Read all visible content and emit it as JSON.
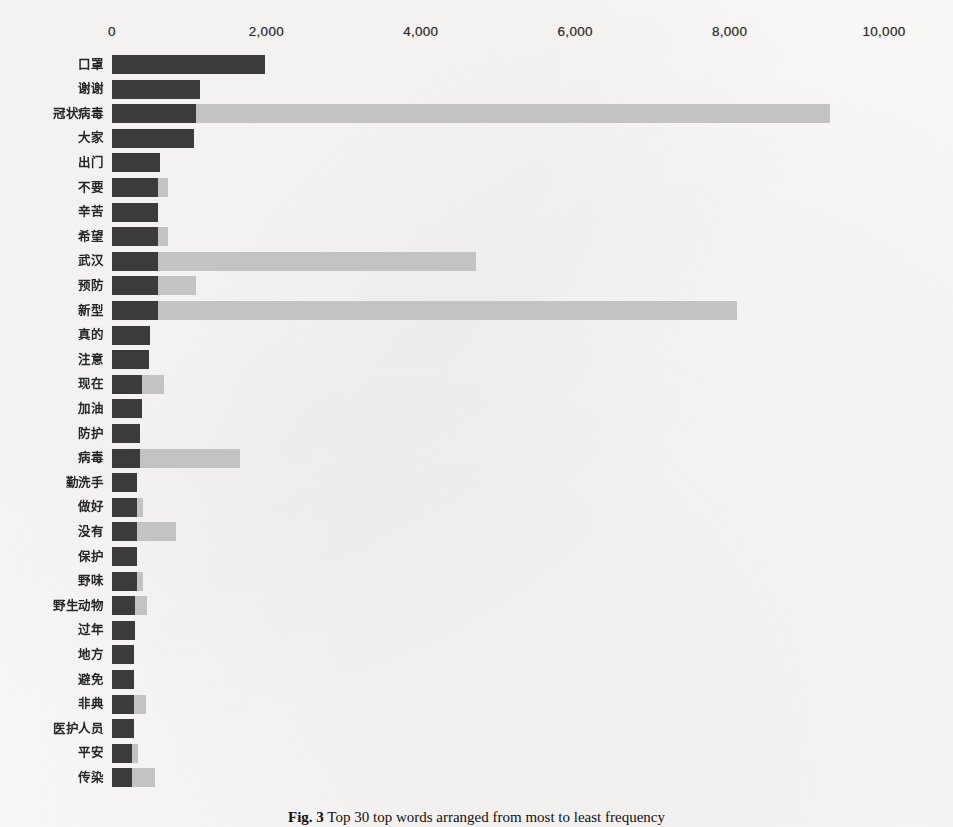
{
  "figure": {
    "caption_label": "Fig. 3",
    "caption_text": "Top 30 top words arranged from most to least frequency",
    "background_color": "#f8f7f5"
  },
  "chart_data": {
    "type": "bar",
    "orientation": "horizontal",
    "stacked": true,
    "title": "",
    "xlabel": "",
    "ylabel": "",
    "xlim": [
      0,
      10800
    ],
    "xticks": [
      0,
      2000,
      4000,
      6000,
      8000,
      10000
    ],
    "xticklabels": [
      "0",
      "2,000",
      "4,000",
      "6,000",
      "8,000",
      "10,000"
    ],
    "grid": false,
    "legend": "none",
    "colors": {
      "series_1": "#3b3b3b",
      "series_2": "#c3c3c3"
    },
    "categories": [
      "口罩",
      "谢谢",
      "冠状病毒",
      "大家",
      "出门",
      "不要",
      "辛苦",
      "希望",
      "武汉",
      "预防",
      "新型",
      "真的",
      "注意",
      "现在",
      "加油",
      "防护",
      "病毒",
      "勤洗手",
      "做好",
      "没有",
      "保护",
      "野味",
      "野生动物",
      "过年",
      "地方",
      "避免",
      "非典",
      "医护人员",
      "平安",
      "传染"
    ],
    "series": [
      {
        "name": "series_1",
        "values": [
          1980,
          1140,
          1090,
          1060,
          620,
          600,
          600,
          590,
          600,
          600,
          600,
          490,
          480,
          390,
          390,
          360,
          360,
          330,
          330,
          330,
          330,
          330,
          300,
          300,
          290,
          290,
          280,
          280,
          260,
          260
        ]
      },
      {
        "name": "series_2",
        "values": [
          0,
          0,
          8210,
          0,
          0,
          130,
          0,
          140,
          4120,
          490,
          7490,
          0,
          0,
          280,
          0,
          0,
          1300,
          0,
          70,
          500,
          0,
          70,
          150,
          0,
          0,
          0,
          160,
          0,
          80,
          300
        ]
      }
    ],
    "totals": [
      1980,
      1140,
      9300,
      1060,
      620,
      730,
      600,
      730,
      4720,
      1090,
      8090,
      490,
      480,
      670,
      390,
      360,
      1660,
      330,
      400,
      830,
      330,
      400,
      450,
      300,
      290,
      290,
      440,
      280,
      340,
      560
    ]
  }
}
